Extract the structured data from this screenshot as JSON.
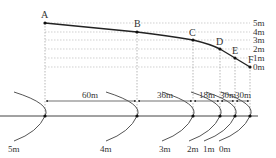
{
  "diagram": {
    "points": [
      {
        "label": "A",
        "x": 45,
        "y": 23
      },
      {
        "label": "B",
        "x": 137,
        "y": 32
      },
      {
        "label": "C",
        "x": 193,
        "y": 40
      },
      {
        "label": "D",
        "x": 220,
        "y": 49
      },
      {
        "label": "E",
        "x": 235,
        "y": 58
      },
      {
        "label": "F",
        "x": 250,
        "y": 67
      }
    ],
    "height_levels": [
      {
        "label": "5m",
        "y": 23
      },
      {
        "label": "4m",
        "y": 32
      },
      {
        "label": "3m",
        "y": 40
      },
      {
        "label": "2m",
        "y": 49
      },
      {
        "label": "1m",
        "y": 58
      },
      {
        "label": "0m",
        "y": 67
      }
    ],
    "segment_distances": [
      {
        "label": "60m",
        "from": "A",
        "to": "B"
      },
      {
        "label": "36m",
        "from": "B",
        "to": "C"
      },
      {
        "label": "18m",
        "from": "C",
        "to": "D"
      },
      {
        "label": "30m",
        "from": "D",
        "to": "E"
      },
      {
        "label": "30m",
        "from": "E",
        "to": "F"
      }
    ],
    "contour_labels": [
      {
        "label": "5m",
        "x": 8
      },
      {
        "label": "4m",
        "x": 100
      },
      {
        "label": "3m",
        "x": 159
      },
      {
        "label": "2m",
        "x": 187
      },
      {
        "label": "1m",
        "x": 203
      },
      {
        "label": "0m",
        "x": 219
      }
    ],
    "colors": {
      "line": "#222222",
      "guide": "#aaaaaa",
      "arc": "#555555",
      "text": "#333333"
    }
  }
}
